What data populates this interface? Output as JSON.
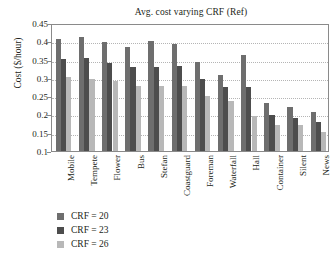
{
  "chart_data": {
    "type": "bar",
    "title": "Avg. cost varying CRF (Ref)",
    "xlabel": "",
    "ylabel": "Cost ($/hour)",
    "ylim": [
      0.1,
      0.45
    ],
    "yticks": [
      0.1,
      0.15,
      0.2,
      0.25,
      0.3,
      0.35,
      0.4,
      0.45
    ],
    "ytick_labels": [
      "0.1",
      "0.15",
      "0.2",
      "0.25",
      "0.3",
      "0.35",
      "0.4",
      "0.45"
    ],
    "grid": true,
    "legend_position": "below-left",
    "categories": [
      "Mobile",
      "Tempete",
      "Flower",
      "Bus",
      "Stefan",
      "Coastguard",
      "Foreman",
      "Waterfall",
      "Hall",
      "Container",
      "Silent",
      "News"
    ],
    "series": [
      {
        "name": "CRF = 20",
        "color": "#6e6e6e",
        "values": [
          0.405,
          0.411,
          0.399,
          0.384,
          0.401,
          0.392,
          0.344,
          0.307,
          0.362,
          0.232,
          0.22,
          0.206
        ]
      },
      {
        "name": "CRF = 23",
        "color": "#4d4d4d",
        "values": [
          0.352,
          0.353,
          0.341,
          0.33,
          0.33,
          0.333,
          0.296,
          0.275,
          0.275,
          0.199,
          0.191,
          0.18
        ]
      },
      {
        "name": "CRF = 26",
        "color": "#b8b8b8",
        "values": [
          0.302,
          0.298,
          0.291,
          0.278,
          0.277,
          0.277,
          0.25,
          0.236,
          0.196,
          0.172,
          0.17,
          0.152
        ]
      }
    ]
  },
  "legend": {
    "items": [
      {
        "label": "CRF = 20",
        "color": "#6e6e6e"
      },
      {
        "label": "CRF = 23",
        "color": "#4d4d4d"
      },
      {
        "label": "CRF = 26",
        "color": "#b8b8b8"
      }
    ]
  }
}
